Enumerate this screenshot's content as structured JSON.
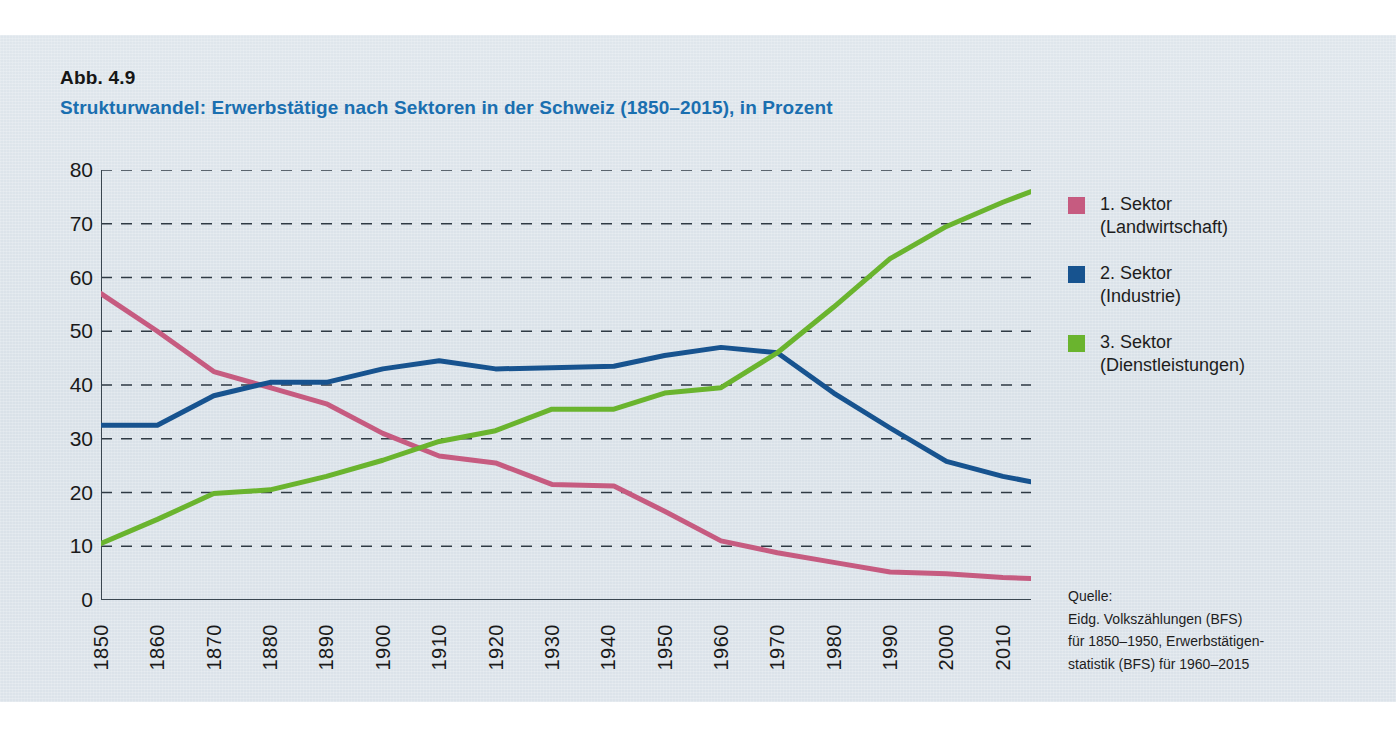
{
  "figure": {
    "number": "Abb. 4.9",
    "title": "Strukturwandel: Erwerbstätige nach Sektoren in der Schweiz (1850–2015), in Prozent",
    "panel_bg": "#dce3ea",
    "title_color": "#1a6fb0"
  },
  "legend": {
    "items": [
      {
        "line1": "1. Sektor",
        "line2": "(Landwirtschaft)",
        "color": "#c65b80"
      },
      {
        "line1": "2. Sektor",
        "line2": "(Industrie)",
        "color": "#17538f"
      },
      {
        "line1": "3. Sektor",
        "line2": "(Dienstleistungen)",
        "color": "#6ab42e"
      }
    ]
  },
  "source": {
    "label": "Quelle:",
    "line1": "Eidg. Volkszählungen (BFS)",
    "line2": "für 1850–1950, Erwerbstätigen-",
    "line3": "statistik (BFS) für 1960–2015"
  },
  "chart_data": {
    "type": "line",
    "title": "Strukturwandel: Erwerbstätige nach Sektoren in der Schweiz (1850–2015), in Prozent",
    "xlabel": "",
    "ylabel": "Prozent",
    "xlim": [
      1850,
      2015
    ],
    "ylim": [
      0,
      80
    ],
    "ytick_labels": [
      "0",
      "10",
      "20",
      "30",
      "40",
      "50",
      "60",
      "70",
      "80"
    ],
    "yticks": [
      0,
      10,
      20,
      30,
      40,
      50,
      60,
      70,
      80
    ],
    "xtick_labels": [
      "1850",
      "1860",
      "1870",
      "1880",
      "1890",
      "1900",
      "1910",
      "1920",
      "1930",
      "1940",
      "1950",
      "1960",
      "1970",
      "1980",
      "1990",
      "2000",
      "2010"
    ],
    "xticks": [
      1850,
      1860,
      1870,
      1880,
      1890,
      1900,
      1910,
      1920,
      1930,
      1940,
      1950,
      1960,
      1970,
      1980,
      1990,
      2000,
      2010
    ],
    "grid": "horizontal-dashed",
    "legend_position": "right",
    "x": [
      1850,
      1860,
      1870,
      1880,
      1890,
      1900,
      1910,
      1920,
      1930,
      1941,
      1950,
      1960,
      1970,
      1980,
      1990,
      2000,
      2010,
      2015
    ],
    "series": [
      {
        "name": "1. Sektor (Landwirtschaft)",
        "color": "#c65b80",
        "values": [
          57.0,
          50.0,
          42.5,
          39.5,
          36.5,
          31.0,
          26.8,
          25.5,
          21.5,
          21.2,
          16.5,
          11.0,
          8.8,
          7.0,
          5.2,
          4.9,
          4.2,
          4.0
        ]
      },
      {
        "name": "2. Sektor (Industrie)",
        "color": "#17538f",
        "values": [
          32.5,
          32.5,
          38.0,
          40.5,
          40.5,
          43.0,
          44.5,
          43.0,
          43.2,
          43.5,
          45.5,
          47.0,
          46.0,
          38.5,
          32.0,
          25.8,
          23.0,
          22.0
        ]
      },
      {
        "name": "3. Sektor (Dienstleistungen)",
        "color": "#6ab42e",
        "values": [
          10.5,
          15.0,
          19.8,
          20.5,
          23.0,
          26.0,
          29.5,
          31.5,
          35.5,
          35.5,
          38.5,
          39.5,
          46.0,
          54.5,
          63.5,
          69.5,
          74.0,
          76.0
        ]
      }
    ]
  }
}
